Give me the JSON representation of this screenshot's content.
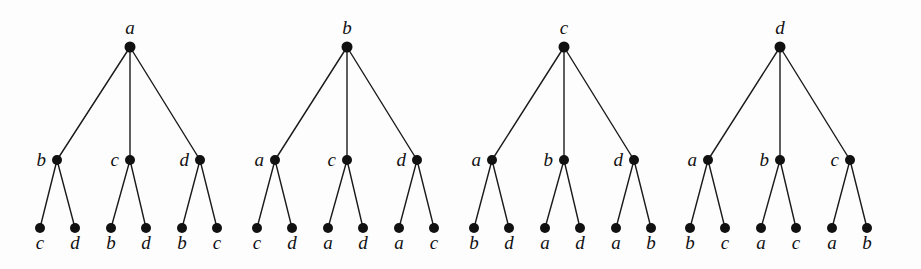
{
  "figure": {
    "background_color": "#fdfdfd",
    "ink_color": "#111111",
    "type": "tree-diagram-set",
    "node_radius": 5,
    "levels": {
      "root_y": 47,
      "mid_y": 160,
      "leaf_y": 228
    },
    "label_offsets": {
      "root_above": 13,
      "mid_left": 11,
      "leaf_below": 21
    }
  },
  "trees": [
    {
      "id": "tree-1",
      "root": {
        "label": "a",
        "x": 130
      },
      "children": [
        {
          "label": "b",
          "x": 57,
          "leaves": [
            {
              "label": "c",
              "x": 40
            },
            {
              "label": "d",
              "x": 75
            }
          ]
        },
        {
          "label": "c",
          "x": 130,
          "leaves": [
            {
              "label": "b",
              "x": 111
            },
            {
              "label": "d",
              "x": 146
            }
          ]
        },
        {
          "label": "d",
          "x": 200,
          "leaves": [
            {
              "label": "b",
              "x": 182
            },
            {
              "label": "c",
              "x": 217
            }
          ]
        }
      ]
    },
    {
      "id": "tree-2",
      "root": {
        "label": "b",
        "x": 347
      },
      "children": [
        {
          "label": "a",
          "x": 275,
          "leaves": [
            {
              "label": "c",
              "x": 257
            },
            {
              "label": "d",
              "x": 292
            }
          ]
        },
        {
          "label": "c",
          "x": 347,
          "leaves": [
            {
              "label": "a",
              "x": 328
            },
            {
              "label": "d",
              "x": 363
            }
          ]
        },
        {
          "label": "d",
          "x": 417,
          "leaves": [
            {
              "label": "a",
              "x": 399
            },
            {
              "label": "c",
              "x": 434
            }
          ]
        }
      ]
    },
    {
      "id": "tree-3",
      "root": {
        "label": "c",
        "x": 564
      },
      "children": [
        {
          "label": "a",
          "x": 492,
          "leaves": [
            {
              "label": "b",
              "x": 474
            },
            {
              "label": "d",
              "x": 509
            }
          ]
        },
        {
          "label": "b",
          "x": 564,
          "leaves": [
            {
              "label": "a",
              "x": 545
            },
            {
              "label": "d",
              "x": 580
            }
          ]
        },
        {
          "label": "d",
          "x": 634,
          "leaves": [
            {
              "label": "a",
              "x": 616
            },
            {
              "label": "b",
              "x": 651
            }
          ]
        }
      ]
    },
    {
      "id": "tree-4",
      "root": {
        "label": "d",
        "x": 780
      },
      "children": [
        {
          "label": "a",
          "x": 708,
          "leaves": [
            {
              "label": "b",
              "x": 690
            },
            {
              "label": "c",
              "x": 725
            }
          ]
        },
        {
          "label": "b",
          "x": 780,
          "leaves": [
            {
              "label": "a",
              "x": 761
            },
            {
              "label": "c",
              "x": 796
            }
          ]
        },
        {
          "label": "c",
          "x": 850,
          "leaves": [
            {
              "label": "a",
              "x": 832
            },
            {
              "label": "b",
              "x": 867
            }
          ]
        }
      ]
    }
  ]
}
